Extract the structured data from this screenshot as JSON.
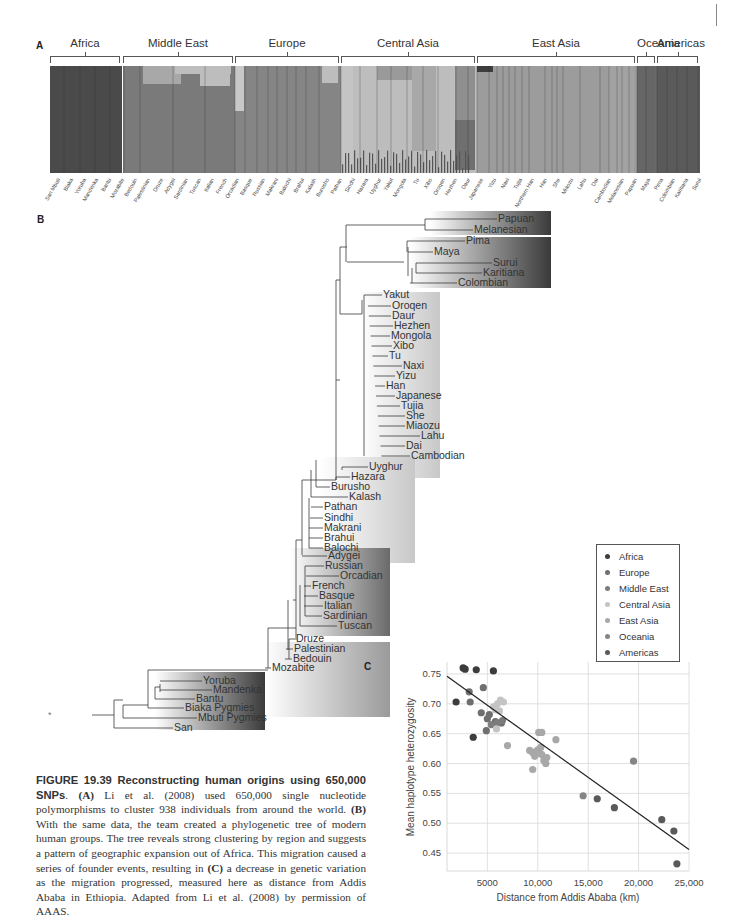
{
  "page_marker": "|",
  "panel_a": {
    "letter": "A",
    "regions": [
      {
        "name": "Africa",
        "x": 50,
        "w": 70,
        "color": "#4a4a4a"
      },
      {
        "name": "Middle East",
        "x": 123,
        "w": 110,
        "color": "#7a7a7a"
      },
      {
        "name": "Europe",
        "x": 235,
        "w": 104,
        "color": "#858585"
      },
      {
        "name": "Central Asia",
        "x": 341,
        "w": 134,
        "color": "#bdbdbd"
      },
      {
        "name": "East Asia",
        "x": 477,
        "w": 158,
        "color": "#9c9c9c"
      },
      {
        "name": "Oceania",
        "x": 637,
        "w": 18,
        "color": "#6a6a6a"
      },
      {
        "name": "Americas",
        "x": 657,
        "w": 41,
        "color": "#5a5a5a"
      }
    ],
    "populations": [
      "San Mbuti",
      "Biaka",
      "Yoruba",
      "Mandenka",
      "Bantu",
      "Mozabite",
      "Bedouin",
      "Palestinian",
      "Druze",
      "Adygei",
      "Sardinian",
      "Tuscan",
      "Italian",
      "French",
      "Orcadian",
      "Basque",
      "Russian",
      "Makrani",
      "Balochi",
      "Brahui",
      "Kalash",
      "Burusho",
      "Pathan",
      "Sindhi",
      "Hazara",
      "Uyghur",
      "Yakut",
      "Mongola",
      "Tu",
      "Xibo",
      "Oroqen",
      "Hezhen",
      "Daur",
      "Japanese",
      "Yizu",
      "Naxi",
      "Tujia",
      "Northern Han",
      "Han",
      "She",
      "Miaozu",
      "Lahu",
      "Dai",
      "Cambodian",
      "Melanesian",
      "Papuan",
      "Maya",
      "Pima",
      "Colombian",
      "Karitiana",
      "Surui"
    ]
  },
  "panel_b": {
    "letter": "B",
    "root_marker": "*",
    "clusters": [
      {
        "name": "Oceania",
        "taxa": [
          "Papuan",
          "Melanesian"
        ]
      },
      {
        "name": "Americas",
        "taxa": [
          "Pima",
          "Maya",
          "Surui",
          "Karitiana",
          "Colombian"
        ]
      },
      {
        "name": "East Asia",
        "taxa": [
          "Yakut",
          "Oroqen",
          "Daur",
          "Hezhen",
          "Mongola",
          "Xibo",
          "Tu",
          "Naxi",
          "Yizu",
          "Han",
          "Japanese",
          "Tujia",
          "She",
          "Miaozu",
          "Lahu",
          "Dai",
          "Cambodian"
        ]
      },
      {
        "name": "Central Asia",
        "taxa": [
          "Uyghur",
          "Hazara",
          "Burusho",
          "Kalash",
          "Pathan",
          "Sindhi",
          "Makrani",
          "Brahui",
          "Balochi"
        ]
      },
      {
        "name": "Europe",
        "taxa": [
          "Adygei",
          "Russian",
          "Orcadian",
          "French",
          "Basque",
          "Italian",
          "Sardinian",
          "Tuscan"
        ]
      },
      {
        "name": "Middle East",
        "taxa": [
          "Druze",
          "Palestinian",
          "Bedouin",
          "Mozabite"
        ]
      },
      {
        "name": "Africa",
        "taxa": [
          "Yoruba",
          "Mandenka",
          "Bantu",
          "Biaka Pygmies",
          "Mbuti Pygmies",
          "San"
        ]
      }
    ]
  },
  "panel_c": {
    "letter": "C"
  },
  "caption": {
    "heading": "FIGURE 19.39  Reconstructing human origins using 650,000 SNPs",
    "body_a_label": "(A)",
    "body_a": " Li et al. (2008) used 650,000 single nucleotide polymorphisms to cluster 938 individuals from around the world. ",
    "body_b_label": "(B)",
    "body_b": " With the same data, the team created a phylogenetic tree of modern human groups. The tree reveals strong clustering by region and suggests a pattern of geographic expansion out of Africa. This migration caused a series of founder events, resulting in ",
    "body_c_label": "(C)",
    "body_c": " a decrease in genetic variation as the migration progressed, measured here as distance from Addis Ababa in Ethiopia. Adapted from Li et al. (2008) by permission of AAAS."
  },
  "chart_data": {
    "type": "scatter",
    "title": "",
    "xlabel": "Distance from Addis Ababa (km)",
    "ylabel": "Mean haplotype heterozygosity",
    "xlim": [
      1000,
      25000
    ],
    "ylim": [
      0.42,
      0.77
    ],
    "xticks": [
      5000,
      10000,
      15000,
      20000,
      25000
    ],
    "xtick_labels": [
      "5000",
      "10,000",
      "15,000",
      "20,000",
      "25,000"
    ],
    "yticks": [
      0.45,
      0.5,
      0.55,
      0.6,
      0.65,
      0.7,
      0.75
    ],
    "ytick_labels": [
      "0.45",
      "0.50",
      "0.55",
      "0.60",
      "0.65",
      "0.70",
      "0.75"
    ],
    "grid": true,
    "legend_position": "upper right",
    "regression_line": {
      "x": [
        1000,
        25000
      ],
      "y": [
        0.746,
        0.456
      ]
    },
    "series": [
      {
        "name": "Africa",
        "color": "#3c3c3c",
        "points": [
          [
            2600,
            0.76
          ],
          [
            2800,
            0.758
          ],
          [
            3900,
            0.757
          ],
          [
            5600,
            0.755
          ],
          [
            3600,
            0.644
          ],
          [
            1900,
            0.703
          ]
        ]
      },
      {
        "name": "Europe",
        "color": "#6f6f6f",
        "points": [
          [
            3200,
            0.72
          ],
          [
            4600,
            0.727
          ],
          [
            3300,
            0.703
          ],
          [
            4400,
            0.685
          ],
          [
            5200,
            0.682
          ],
          [
            5000,
            0.675
          ],
          [
            5800,
            0.67
          ],
          [
            6400,
            0.668
          ],
          [
            4900,
            0.655
          ]
        ]
      },
      {
        "name": "Middle East",
        "color": "#7c7c7c",
        "points": [
          [
            5400,
            0.665
          ],
          [
            6000,
            0.668
          ],
          [
            6500,
            0.672
          ]
        ]
      },
      {
        "name": "Central Asia",
        "color": "#c4c4c4",
        "points": [
          [
            5600,
            0.695
          ],
          [
            6000,
            0.7
          ],
          [
            6300,
            0.706
          ],
          [
            6600,
            0.703
          ],
          [
            5800,
            0.69
          ],
          [
            6200,
            0.688
          ],
          [
            5900,
            0.658
          ]
        ]
      },
      {
        "name": "East Asia",
        "color": "#a8a8a8",
        "points": [
          [
            7000,
            0.63
          ],
          [
            9200,
            0.622
          ],
          [
            9500,
            0.618
          ],
          [
            9800,
            0.62
          ],
          [
            10000,
            0.623
          ],
          [
            10200,
            0.617
          ],
          [
            10400,
            0.615
          ],
          [
            9700,
            0.612
          ],
          [
            10600,
            0.605
          ],
          [
            10800,
            0.6
          ],
          [
            10100,
            0.652
          ],
          [
            10400,
            0.652
          ],
          [
            11800,
            0.64
          ],
          [
            10900,
            0.61
          ],
          [
            9500,
            0.59
          ],
          [
            10300,
            0.627
          ]
        ]
      },
      {
        "name": "Oceania",
        "color": "#858585",
        "points": [
          [
            19500,
            0.604
          ],
          [
            14500,
            0.546
          ]
        ]
      },
      {
        "name": "Americas",
        "color": "#5a5a5a",
        "points": [
          [
            15900,
            0.541
          ],
          [
            17600,
            0.526
          ],
          [
            22300,
            0.506
          ],
          [
            23500,
            0.487
          ],
          [
            23800,
            0.432
          ]
        ]
      }
    ]
  }
}
